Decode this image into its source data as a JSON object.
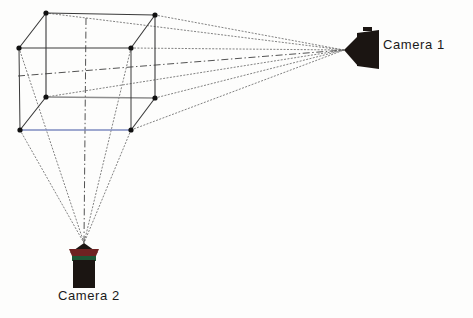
{
  "figure": {
    "background_color": "#fdfdfc"
  },
  "labels": {
    "camera1": "Camera 1",
    "camera2": "Camera 2"
  },
  "icons": {
    "camera1": "video-camera-icon",
    "camera2": "video-camera-icon"
  },
  "colors": {
    "edge_dark": "#3a3a3a",
    "edge_gray": "#8d8d8d",
    "edge_blue": "#7f8cc0",
    "ray_dotted": "#6b6b6b",
    "axis_dashdot": "#4a4a4a",
    "vertex": "#111111",
    "camera_body": "#1b1512",
    "camera2_lens_rim": "#6e2222",
    "camera2_band": "#1d5535",
    "text": "#1a1a1a"
  },
  "geometry": {
    "cube_vertices": [
      {
        "name": "back-top-left",
        "x": 46,
        "y": 13
      },
      {
        "name": "back-top-right",
        "x": 155,
        "y": 15
      },
      {
        "name": "front-top-left",
        "x": 19,
        "y": 48
      },
      {
        "name": "front-top-right",
        "x": 131,
        "y": 48
      },
      {
        "name": "back-bottom-left",
        "x": 46,
        "y": 97
      },
      {
        "name": "back-bottom-right",
        "x": 155,
        "y": 98
      },
      {
        "name": "front-bottom-left",
        "x": 20,
        "y": 130
      },
      {
        "name": "front-bottom-right",
        "x": 131,
        "y": 130
      }
    ],
    "camera1_center": {
      "x": 352,
      "y": 49
    },
    "camera2_center": {
      "x": 84,
      "y": 266
    },
    "camera1_focal_point": {
      "x": 344,
      "y": 50
    },
    "camera2_focal_point": {
      "x": 84,
      "y": 243
    }
  },
  "rays": {
    "camera1_targets": [
      "back-top-left",
      "back-top-right",
      "back-bottom-left",
      "back-bottom-right",
      "front-top-right",
      "front-bottom-right"
    ],
    "camera2_targets": [
      "front-top-left",
      "front-bottom-left",
      "front-bottom-right",
      "front-top-right"
    ]
  },
  "optical_axes": [
    {
      "name": "camera1-optical-axis",
      "from": {
        "x": 18,
        "y": 76
      },
      "to": {
        "x": 344,
        "y": 50
      }
    },
    {
      "name": "camera2-optical-axis",
      "from": {
        "x": 86,
        "y": 18
      },
      "to": {
        "x": 84,
        "y": 243
      }
    }
  ]
}
